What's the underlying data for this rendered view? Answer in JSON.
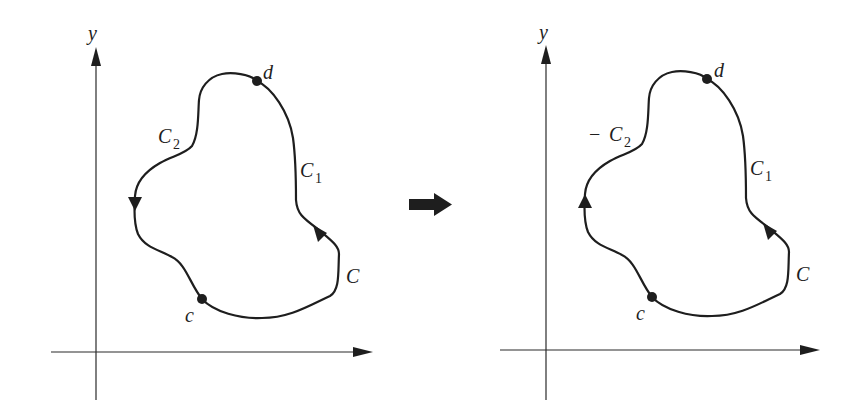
{
  "diagram": {
    "colors": {
      "ink": "#1e1e1e",
      "axis": "#2a2a2a",
      "background": "#ffffff"
    },
    "transform_arrow": {
      "icon": "right-arrow-icon"
    },
    "left_panel": {
      "axis_y_label": "y",
      "point_d_label": "d",
      "point_c_label": "c",
      "curve_c1_label": "C",
      "curve_c1_sub": "1",
      "curve_c2_prefix": "",
      "curve_c2_label": "C",
      "curve_c2_sub": "2",
      "curve_label": "C",
      "c2_direction": "down"
    },
    "right_panel": {
      "axis_y_label": "y",
      "point_d_label": "d",
      "point_c_label": "c",
      "curve_c1_label": "C",
      "curve_c1_sub": "1",
      "curve_c2_prefix": "−",
      "curve_c2_label": "C",
      "curve_c2_sub": "2",
      "curve_label": "C",
      "c2_direction": "up"
    }
  }
}
